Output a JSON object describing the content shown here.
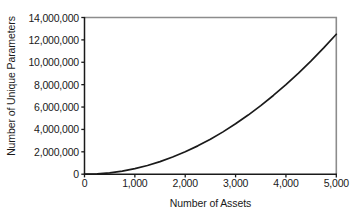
{
  "chart_data": {
    "type": "line",
    "title": "",
    "xlabel": "Number of Assets",
    "ylabel": "Number of Unique Parameters",
    "xlim": [
      0,
      5000
    ],
    "ylim": [
      0,
      14000000
    ],
    "grid": false,
    "legend": "none",
    "xticklabels": [
      "0",
      "1,000",
      "2,000",
      "3,000",
      "4,000",
      "5,000"
    ],
    "xticks": [
      0,
      1000,
      2000,
      3000,
      4000,
      5000
    ],
    "yticklabels": [
      "0",
      "2,000,000",
      "4,000,000",
      "6,000,000",
      "8,000,000",
      "10,000,000",
      "12,000,000",
      "14,000,000"
    ],
    "yticks": [
      0,
      2000000,
      4000000,
      6000000,
      8000000,
      10000000,
      12000000,
      14000000
    ],
    "series": [
      {
        "name": "Unique parameters",
        "color": "#1a1a1a",
        "x": [
          0,
          250,
          500,
          750,
          1000,
          1250,
          1500,
          1750,
          2000,
          2250,
          2500,
          2750,
          3000,
          3250,
          3500,
          3750,
          4000,
          4250,
          4500,
          4750,
          5000
        ],
        "values": [
          0,
          31375,
          125250,
          281625,
          500500,
          781875,
          1125750,
          1532125,
          2001000,
          2532375,
          3126250,
          3782625,
          4501500,
          5282875,
          6126750,
          7033125,
          8002000,
          9033375,
          10127250,
          11283625,
          12502500
        ]
      }
    ]
  },
  "axes": {
    "frame_color": "#8c8c8c",
    "axis_color": "#1a1a1a",
    "curve_color": "#1a1a1a"
  }
}
